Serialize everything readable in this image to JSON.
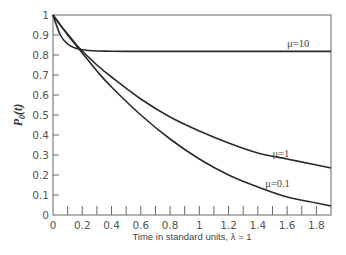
{
  "chart_data": {
    "type": "line",
    "title": "",
    "xlabel": "Time in standard units, λ = 1",
    "ylabel": "P0(t)",
    "ylabel_main": "P",
    "ylabel_sub": "0",
    "ylabel_arg": "(t)",
    "xlim": [
      0,
      1.9
    ],
    "ylim": [
      0,
      1
    ],
    "grid": false,
    "legend_position": "inline labels",
    "x_ticks": [
      "0",
      "0.2",
      "0.4",
      "0.6",
      "0.8",
      "1",
      "1.2",
      "1.4",
      "1.6",
      "1.8"
    ],
    "y_ticks": [
      "0",
      "0.1",
      "0.2",
      "0.3",
      "0.4",
      "0.5",
      "0.6",
      "0.7",
      "0.8",
      "0.9",
      "1"
    ],
    "x": [
      0,
      0.05,
      0.1,
      0.15,
      0.2,
      0.3,
      0.4,
      0.6,
      0.8,
      1.0,
      1.2,
      1.4,
      1.6,
      1.8,
      1.9
    ],
    "series": [
      {
        "name": "μ=10",
        "label": "μ=10",
        "values": [
          1.0,
          0.9,
          0.855,
          0.835,
          0.826,
          0.82,
          0.819,
          0.818,
          0.818,
          0.818,
          0.818,
          0.818,
          0.818,
          0.818,
          0.818
        ]
      },
      {
        "name": "μ=1",
        "label": "μ=1",
        "values": [
          1.0,
          0.95,
          0.905,
          0.86,
          0.82,
          0.75,
          0.69,
          0.58,
          0.49,
          0.42,
          0.36,
          0.31,
          0.28,
          0.25,
          0.235
        ]
      },
      {
        "name": "μ=0.1",
        "label": "μ=0.1",
        "values": [
          1.0,
          0.95,
          0.9,
          0.855,
          0.81,
          0.72,
          0.64,
          0.5,
          0.38,
          0.28,
          0.2,
          0.14,
          0.09,
          0.06,
          0.045
        ]
      }
    ],
    "label_positions": {
      "μ=10": [
        1.6,
        0.84
      ],
      "μ=1": [
        1.5,
        0.29
      ],
      "μ=0.1": [
        1.45,
        0.14
      ]
    }
  }
}
